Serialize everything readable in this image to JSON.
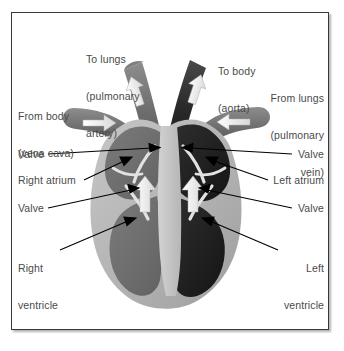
{
  "diagram": {
    "style": "grayscale anatomical illustration with leader-line labels",
    "frame": {
      "border_color": "#3a3a3a",
      "background": "#ffffff"
    },
    "palette": {
      "background": "#ffffff",
      "myocardium_light_gray": "#b9b9b9",
      "right_chamber_gray": "#6f6f6f",
      "left_chamber_dark": "#242424",
      "vessel_mid_gray": "#7a7a7a",
      "septum_light": "#c9c9c9",
      "flow_arrow_white": "#f2f2f2",
      "leader_line": "#000000",
      "label_text": "#4a4a4a"
    },
    "labels": [
      {
        "id": "to-lungs",
        "side": "top-left",
        "align": "left",
        "lines": [
          "To lungs",
          "(pulmonary",
          "artery)"
        ]
      },
      {
        "id": "to-body",
        "side": "top-right",
        "align": "left",
        "lines": [
          "To body",
          "(aorta)"
        ]
      },
      {
        "id": "from-body",
        "side": "left",
        "align": "left",
        "lines": [
          "From body",
          "(vena cava)"
        ]
      },
      {
        "id": "from-lungs",
        "side": "right",
        "align": "right",
        "lines": [
          "From lungs",
          "(pulmonary",
          "vein)"
        ]
      },
      {
        "id": "valve-upper-left",
        "side": "left",
        "align": "left",
        "lines": [
          "Valve"
        ]
      },
      {
        "id": "right-atrium",
        "side": "left",
        "align": "left",
        "lines": [
          "Right atrium"
        ]
      },
      {
        "id": "valve-lower-left",
        "side": "left",
        "align": "left",
        "lines": [
          "Valve"
        ]
      },
      {
        "id": "right-ventricle",
        "side": "left",
        "align": "left",
        "lines": [
          "Right",
          "ventricle"
        ]
      },
      {
        "id": "valve-upper-right",
        "side": "right",
        "align": "right",
        "lines": [
          "Valve"
        ]
      },
      {
        "id": "left-atrium",
        "side": "right",
        "align": "right",
        "lines": [
          "Left atrium"
        ]
      },
      {
        "id": "valve-lower-right",
        "side": "right",
        "align": "right",
        "lines": [
          "Valve"
        ]
      },
      {
        "id": "left-ventricle",
        "side": "right",
        "align": "right",
        "lines": [
          "Left",
          "ventricle"
        ]
      }
    ],
    "flow_arrows": [
      {
        "id": "vena-cava-inflow",
        "direction": "right"
      },
      {
        "id": "pulmonary-vein-inflow",
        "direction": "left"
      },
      {
        "id": "pulmonary-artery-outflow",
        "direction": "up"
      },
      {
        "id": "aorta-outflow",
        "direction": "up"
      },
      {
        "id": "right-ventricle-flow",
        "direction": "up"
      },
      {
        "id": "left-ventricle-flow",
        "direction": "up"
      }
    ]
  }
}
